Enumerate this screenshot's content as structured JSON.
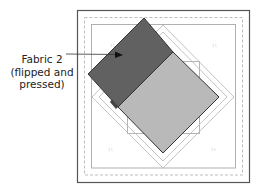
{
  "callout": {
    "line1": "Fabric 2",
    "line2": "(flipped and",
    "line3": "pressed)"
  },
  "corner_labels": {
    "top_left": "11",
    "top_right": "11",
    "bottom_left": "11",
    "bottom_right": "11"
  },
  "colors": {
    "frame": "#555555",
    "dashed": "#b5b5b5",
    "inner_square": "#b0b0b0",
    "diamond_line": "#c4c4c4",
    "fabric2_fill": "#616161",
    "fabric1_fill": "#b9b9b9",
    "outline": "#333333",
    "label": "#cfcfcf"
  }
}
